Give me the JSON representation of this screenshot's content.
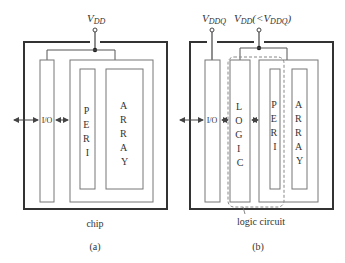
{
  "panel_a": {
    "supply_label": "V",
    "supply_sub": "DD",
    "io_label": "I/O",
    "peri_letters": [
      "P",
      "E",
      "R",
      "I"
    ],
    "array_letters": [
      "A",
      "R",
      "R",
      "A",
      "Y"
    ],
    "chip_label": "chip",
    "caption": "(a)"
  },
  "panel_b": {
    "supply_q_label": "V",
    "supply_q_sub": "DDQ",
    "supply_label": "V",
    "supply_sub": "DD",
    "supply_cond_open": "(<V",
    "supply_cond_sub": "DDQ",
    "supply_cond_close": ")",
    "io_label": "I/O",
    "logic_letters": [
      "L",
      "O",
      "G",
      "I",
      "C"
    ],
    "peri_letters": [
      "P",
      "E",
      "R",
      "I"
    ],
    "array_letters": [
      "A",
      "R",
      "R",
      "A",
      "Y"
    ],
    "logic_circuit_label": "logic circuit",
    "caption": "(b)"
  },
  "colors": {
    "chip_outline": "#333333",
    "block_outline": "#777777",
    "dashed": "#888888",
    "text": "#333333"
  }
}
